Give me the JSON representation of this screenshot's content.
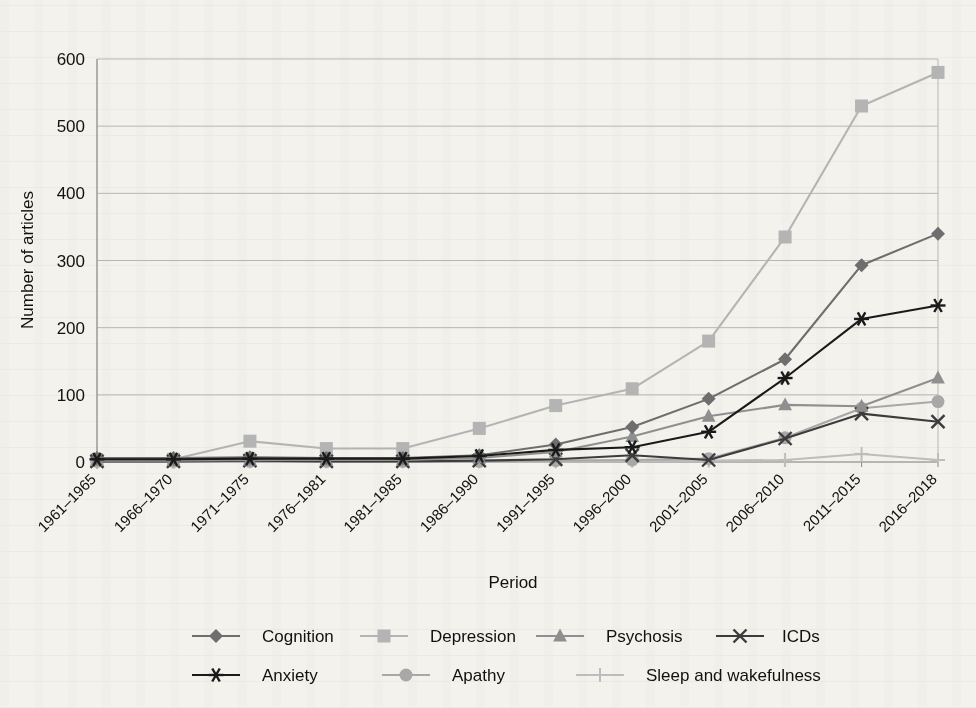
{
  "chart_data": {
    "type": "line",
    "title": "",
    "xlabel": "Period",
    "ylabel": "Number of articles",
    "ylim": [
      0,
      600
    ],
    "yticks": [
      0,
      100,
      200,
      300,
      400,
      500,
      600
    ],
    "grid": true,
    "legend_position": "bottom",
    "categories": [
      "1961–1965",
      "1966–1970",
      "1971–1975",
      "1976–1981",
      "1981–1985",
      "1986–1990",
      "1991–1995",
      "1996–2000",
      "2001–2005",
      "2006–2010",
      "2011–2015",
      "2016–2018"
    ],
    "series": [
      {
        "name": "Cognition",
        "marker": "diamond",
        "color": "#6e6e6e",
        "line_color": "#6e6e6e",
        "values": [
          6,
          6,
          7,
          6,
          6,
          10,
          26,
          52,
          94,
          153,
          293,
          340
        ]
      },
      {
        "name": "Depression",
        "marker": "square",
        "color": "#b4b4b4",
        "line_color": "#b4b4b4",
        "values": [
          3,
          4,
          31,
          20,
          20,
          50,
          84,
          109,
          180,
          335,
          530,
          580
        ]
      },
      {
        "name": "Psychosis",
        "marker": "triangle",
        "color": "#8f8f8f",
        "line_color": "#8f8f8f",
        "values": [
          2,
          2,
          3,
          3,
          3,
          6,
          15,
          38,
          68,
          85,
          83,
          125
        ]
      },
      {
        "name": "ICDs",
        "marker": "cross-x",
        "color": "#3c3c3c",
        "line_color": "#3c3c3c",
        "values": [
          1,
          1,
          2,
          1,
          1,
          2,
          4,
          10,
          3,
          35,
          72,
          60
        ]
      },
      {
        "name": "Anxiety",
        "marker": "asterisk",
        "color": "#1a1a1a",
        "line_color": "#1a1a1a",
        "values": [
          4,
          4,
          5,
          5,
          5,
          9,
          18,
          22,
          45,
          125,
          213,
          233
        ]
      },
      {
        "name": "Apathy",
        "marker": "circle",
        "color": "#a8a8a8",
        "line_color": "#a8a8a8",
        "values": [
          1,
          1,
          1,
          1,
          1,
          1,
          2,
          3,
          5,
          36,
          80,
          90
        ]
      },
      {
        "name": "Sleep and wakefulness",
        "marker": "plus",
        "color": "#bdbdbd",
        "line_color": "#bdbdbd",
        "values": [
          0,
          0,
          1,
          1,
          1,
          1,
          1,
          2,
          2,
          3,
          12,
          3
        ]
      }
    ]
  },
  "legend": {
    "rows": [
      [
        "Cognition",
        "Depression",
        "Psychosis",
        "ICDs"
      ],
      [
        "Anxiety",
        "Apathy",
        "Sleep and wakefulness"
      ]
    ]
  },
  "colors": {
    "background": "#f4f2ec",
    "gridline": "#b9b6ae",
    "axis": "#9a978f",
    "text": "#1a1a1a"
  }
}
